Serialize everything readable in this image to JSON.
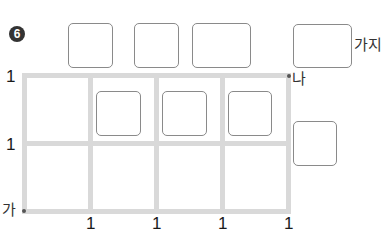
{
  "problem": {
    "number_badge": "6"
  },
  "labels": {
    "ways_unit": "가지",
    "start_point": "가",
    "end_point": "나"
  },
  "grid": {
    "columns": 4,
    "rows": 2,
    "left_axis_labels": [
      "1",
      "1"
    ],
    "bottom_axis_labels": [
      "1",
      "1",
      "1",
      "1"
    ],
    "line_color": "#d9d9d9"
  },
  "answer_boxes": {
    "top_row_count": 3,
    "inner_row_count": 3,
    "right_side_count": 1,
    "total_answer_count": 1,
    "border_color": "#8a8a8a"
  }
}
